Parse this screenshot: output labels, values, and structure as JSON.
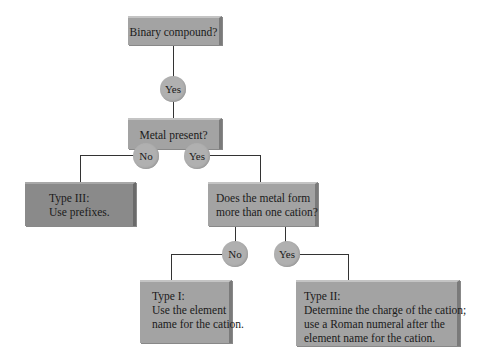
{
  "diagram": {
    "type": "flowchart",
    "nodes": {
      "q1": {
        "label": "Binary compound?"
      },
      "a1": {
        "label": "Yes"
      },
      "q2": {
        "label": "Metal present?"
      },
      "a2_no": {
        "label": "No"
      },
      "a2_yes": {
        "label": "Yes"
      },
      "type3": {
        "title": "Type III:",
        "lines": [
          "Use prefixes."
        ]
      },
      "q3": {
        "lines": [
          "Does the metal form",
          "more than one cation?"
        ]
      },
      "a3_no": {
        "label": "No"
      },
      "a3_yes": {
        "label": "Yes"
      },
      "type1": {
        "title": "Type I:",
        "lines": [
          "Use the element",
          "name for the cation."
        ]
      },
      "type2": {
        "title": "Type II:",
        "lines": [
          "Determine the charge of the cation;",
          "use a Roman numeral after the",
          "element name for the cation."
        ]
      }
    },
    "edges": [
      [
        "q1",
        "a1"
      ],
      [
        "a1",
        "q2"
      ],
      [
        "q2",
        "a2_no"
      ],
      [
        "q2",
        "a2_yes"
      ],
      [
        "a2_no",
        "type3"
      ],
      [
        "a2_yes",
        "q3"
      ],
      [
        "q3",
        "a3_no"
      ],
      [
        "q3",
        "a3_yes"
      ],
      [
        "a3_no",
        "type1"
      ],
      [
        "a3_yes",
        "type2"
      ]
    ]
  }
}
